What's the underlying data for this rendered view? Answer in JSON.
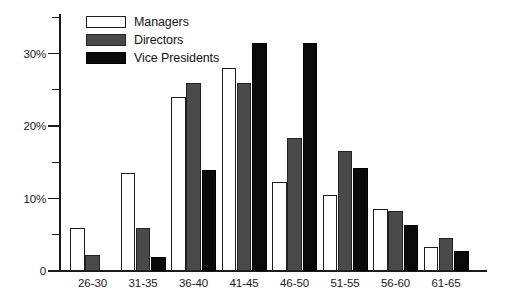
{
  "chart_data": {
    "type": "bar",
    "title": "",
    "xlabel": "",
    "ylabel": "",
    "ylim": [
      0,
      35.5
    ],
    "grid": false,
    "legend_position": "top-left",
    "categories": [
      "26-30",
      "31-35",
      "36-40",
      "41-45",
      "46-50",
      "51-55",
      "56-60",
      "61-65"
    ],
    "ytick_labels": [
      "0",
      "10%",
      "20%",
      "30%"
    ],
    "ytick_values": [
      0,
      10,
      20,
      30
    ],
    "yminor_values": [
      5,
      15,
      25,
      35
    ],
    "series": [
      {
        "name": "Managers",
        "color": "#ffffff",
        "values": [
          6.0,
          13.5,
          24.0,
          28.0,
          12.3,
          10.5,
          8.5,
          3.3
        ]
      },
      {
        "name": "Directors",
        "color": "#4a4a4a",
        "values": [
          2.2,
          6.0,
          26.0,
          26.0,
          18.3,
          16.5,
          8.3,
          4.5
        ]
      },
      {
        "name": "Vice Presidents",
        "color": "#0a0a0a",
        "values": [
          0,
          2.0,
          14.0,
          31.5,
          31.5,
          14.2,
          6.3,
          2.7
        ]
      }
    ]
  },
  "legend": {
    "items": [
      {
        "label": "Managers",
        "key": "managers"
      },
      {
        "label": "Directors",
        "key": "directors"
      },
      {
        "label": "Vice Presidents",
        "key": "vps"
      }
    ]
  }
}
